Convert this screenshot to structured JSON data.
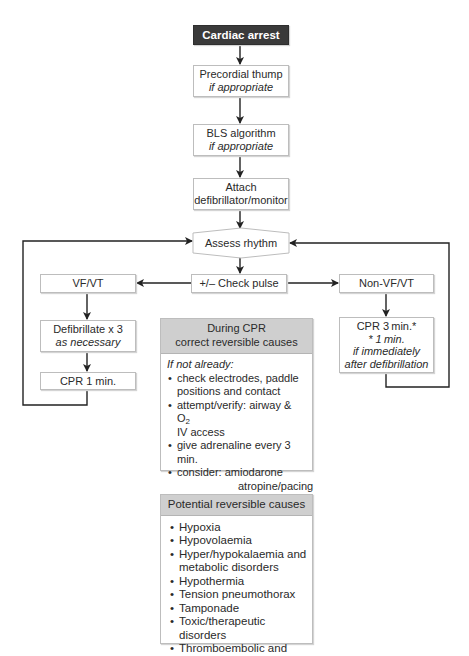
{
  "diagram": {
    "start": {
      "label": "Cardiac arrest"
    },
    "precordial": {
      "line1": "Precordial thump",
      "line2": "if appropriate"
    },
    "bls": {
      "line1": "BLS algorithm",
      "line2": "if appropriate"
    },
    "attach": {
      "line1": "Attach",
      "line2": "defibrillator/monitor"
    },
    "assess": {
      "label": "Assess rhythm"
    },
    "check_pulse": {
      "label": "+/– Check pulse"
    },
    "vfvt": {
      "label": "VF/VT"
    },
    "defibrillate": {
      "line1": "Defibrillate x 3",
      "line2": "as necessary"
    },
    "cpr1": {
      "label": "CPR 1 min."
    },
    "nonvfvt": {
      "label": "Non-VF/VT"
    },
    "cpr3": {
      "line1": "CPR 3 min.*",
      "line2": "* 1 min.",
      "line3": "if immediately",
      "line4": "after defibrillation"
    },
    "during_cpr": {
      "title1": "During CPR",
      "title2": "correct reversible causes",
      "intro": "If not already:",
      "items": [
        "check electrodes, paddle positions and contact",
        "attempt/verify:  airway & O",
        "IV access",
        "give adrenaline every 3 min.",
        "consider:  amiodarone"
      ],
      "o2_sub": "2",
      "consider_more": [
        "atropine/pacing",
        "buffers"
      ]
    },
    "reversible_causes": {
      "title": "Potential reversible causes",
      "items": [
        "Hypoxia",
        "Hypovolaemia",
        "Hyper/hypokalaemia and metabolic disorders",
        "Hypothermia",
        "Tension pneumothorax",
        "Tamponade",
        "Toxic/therapeutic disorders",
        "Thromboembolic and"
      ]
    },
    "colors": {
      "start_fill": "#3a3a3a",
      "header_fill": "#cfcfcf",
      "line": "#222222",
      "border": "#bdbdbd"
    }
  }
}
